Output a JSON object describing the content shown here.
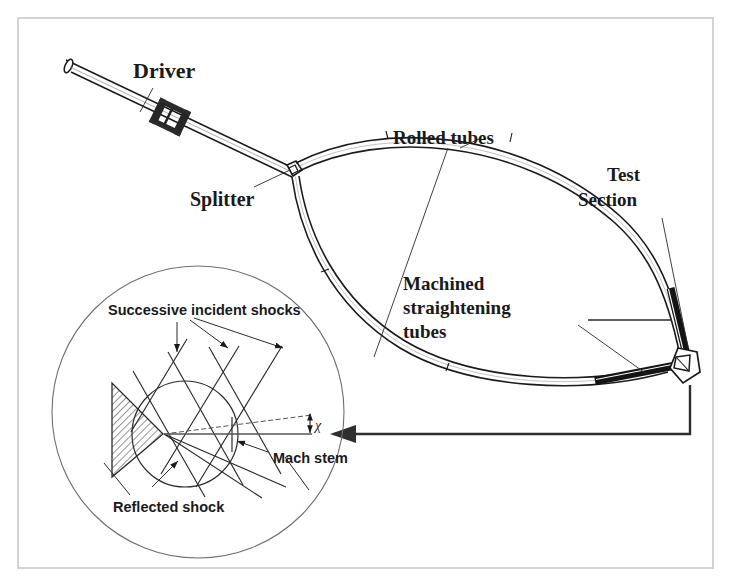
{
  "figure": {
    "frame_color": "#c9c9c9",
    "line_color": "#1a1a1a",
    "hatch_color": "#4a4a4a",
    "background": "#ffffff",
    "width": 731,
    "height": 586
  },
  "main_diagram": {
    "labels": {
      "driver": "Driver",
      "splitter": "Splitter",
      "rolled_tubes": "Rolled tubes",
      "test_section_line1": "Test",
      "test_section_line2": "Section",
      "machined_line1": "Machined",
      "machined_line2": "straightening",
      "machined_line3": "tubes"
    }
  },
  "detail_inset": {
    "labels": {
      "successive_incident_shocks": "Successive incident shocks",
      "reflected_shock": "Reflected shock",
      "mach_stem": "Mach stem",
      "angle_symbol": "χ"
    }
  }
}
